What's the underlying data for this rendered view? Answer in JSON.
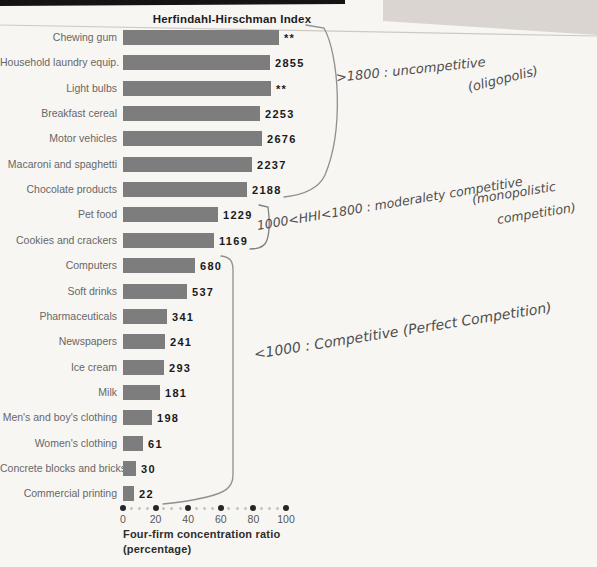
{
  "page": {
    "background": "#f8f6f3",
    "backdrop_color": "#d9d4d0",
    "top_bar_color": "#141414",
    "page_edge_line_color": "#cfc9c3",
    "bracket_color": "#8f8f8f"
  },
  "chart_data": {
    "type": "bar",
    "orientation": "horizontal",
    "title": "Herfindahl-Hirschman Index",
    "xlabel_line1": "Four-firm concentration ratio",
    "xlabel_line2": "(percentage)",
    "x_axis": {
      "min": 0,
      "max": 100,
      "major_ticks": [
        0,
        20,
        40,
        60,
        80,
        100
      ],
      "minor_step": 5
    },
    "bar_color": "#7d7d7d",
    "categories": [
      "Chewing gum",
      "Household laundry equip.",
      "Light bulbs",
      "Breakfast cereal",
      "Motor vehicles",
      "Macaroni and spaghetti",
      "Chocolate products",
      "Pet food",
      "Cookies and crackers",
      "Computers",
      "Soft drinks",
      "Pharmaceuticals",
      "Newspapers",
      "Ice cream",
      "Milk",
      "Men's and boy's clothing",
      "Women's clothing",
      "Concrete blocks and bricks",
      "Commercial printing"
    ],
    "series": [
      {
        "name": "Four-firm concentration ratio (percentage)",
        "values": [
          96,
          90,
          91,
          84,
          85,
          79,
          76,
          58,
          56,
          44,
          39,
          27,
          26,
          25,
          23,
          18,
          12,
          8,
          7
        ]
      },
      {
        "name": "Herfindahl-Hirschman Index (bar-end labels)",
        "values": [
          "**",
          "2855",
          "**",
          "2253",
          "2676",
          "2237",
          "2188",
          "1229",
          "1169",
          "680",
          "537",
          "341",
          "241",
          "293",
          "181",
          "198",
          "61",
          "30",
          "22"
        ]
      }
    ]
  },
  "annotations": {
    "group_high": {
      "line1": ">1800 : uncompetitive",
      "line2": "(oligopolis)"
    },
    "group_mid": {
      "line1": "1000<HHI<1800 : moderalety competitive",
      "line2": "(monopolistic",
      "line3": "competition)"
    },
    "group_low": {
      "line1": "<1000 : Competitive (Perfect Competition)"
    }
  }
}
